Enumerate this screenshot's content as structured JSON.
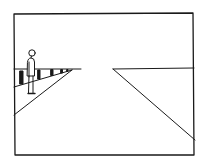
{
  "figure": {
    "stroke_color": "#1a1a1a",
    "background": "#ffffff",
    "frame": {
      "x1": 14,
      "y1": 13,
      "x2": 194,
      "y2": 155
    },
    "horizon_y": 69,
    "left_horizon": {
      "x1": 14,
      "x2": 81
    },
    "right_horizon": {
      "x1": 113,
      "x2": 194,
      "y2": 68
    },
    "left_road_edge": {
      "from": [
        72,
        70
      ],
      "to": [
        14,
        115
      ]
    },
    "right_road_edge": {
      "from": [
        113,
        69
      ],
      "to": [
        195,
        140
      ]
    },
    "railing": {
      "bottom_line": {
        "from": [
          14,
          87
        ],
        "to": [
          72,
          70
        ]
      },
      "posts_x": [
        20,
        38,
        51,
        61,
        67
      ]
    },
    "person": {
      "head": [
        32,
        53
      ],
      "head_r": 3.2
    }
  }
}
